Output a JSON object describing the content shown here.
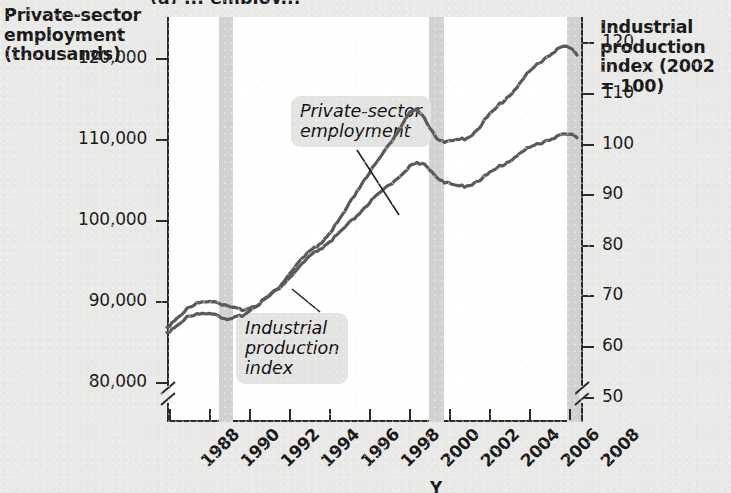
{
  "figure": {
    "clipped_title": "(a) ... employ...",
    "left_axis_title": "Private-sector\nemployment\n(thousands)",
    "right_axis_title": "Industrial\nproduction\nindex (2002\n= 100)",
    "x_axis_title": "Y"
  },
  "annotations": {
    "employment_label": "Private-sector\nemployment",
    "ipi_label": "Industrial\nproduction\nindex"
  },
  "axes": {
    "left_ticks": [
      "120,000",
      "110,000",
      "100,000",
      "90,000",
      "80,000"
    ],
    "right_ticks": [
      "120",
      "110",
      "100",
      "90",
      "80",
      "70",
      "60",
      "50"
    ],
    "x_ticks": [
      "1988",
      "1990",
      "1992",
      "1994",
      "1996",
      "1998",
      "2000",
      "2002",
      "2004",
      "2006",
      "2008"
    ]
  },
  "colors": {
    "page_background": "#e9e9e7",
    "plot_background": "#ffffff",
    "axis": "#2a2a2a",
    "series_line": "#5a5a5a",
    "recession_band": "#d2d2d0",
    "callout_background": "#e4e4e2"
  },
  "chart_data": {
    "type": "line",
    "title": "",
    "xlabel": "Year",
    "ylabel": "Private-sector employment (thousands)",
    "y2label": "Industrial production index (2002 = 100)",
    "xlim": [
      1988,
      2008.8
    ],
    "ylim": [
      75000,
      125000
    ],
    "y2lim": [
      45,
      125
    ],
    "grid": false,
    "legend": "inline-annotations",
    "x_tick_step": 2,
    "recession_bands": [
      {
        "start": 1990.5,
        "end": 1991.2
      },
      {
        "start": 2001.0,
        "end": 2001.75
      },
      {
        "start": 2007.9,
        "end": 2008.6
      }
    ],
    "series": [
      {
        "name": "Private-sector employment",
        "axis": "left",
        "units": "thousands",
        "x": [
          1988.0,
          1988.5,
          1989.0,
          1989.5,
          1990.0,
          1990.5,
          1991.0,
          1991.5,
          1992.0,
          1992.5,
          1993.0,
          1993.5,
          1994.0,
          1994.5,
          1995.0,
          1995.5,
          1996.0,
          1996.5,
          1997.0,
          1997.5,
          1998.0,
          1998.5,
          1999.0,
          1999.5,
          2000.0,
          2000.5,
          2001.0,
          2001.5,
          2002.0,
          2002.5,
          2003.0,
          2003.5,
          2004.0,
          2004.5,
          2005.0,
          2005.5,
          2006.0,
          2006.5,
          2007.0,
          2007.5,
          2008.0,
          2008.5
        ],
        "y": [
          86600,
          87800,
          88800,
          89500,
          89900,
          89800,
          89100,
          88800,
          88900,
          89400,
          90200,
          91200,
          92400,
          93700,
          95000,
          96000,
          96900,
          97900,
          99100,
          100400,
          101700,
          102800,
          103900,
          105000,
          106200,
          106800,
          106500,
          105200,
          104300,
          104000,
          104100,
          104600,
          105400,
          106200,
          107000,
          107800,
          108600,
          109200,
          109700,
          110200,
          110400,
          110100
        ]
      },
      {
        "name": "Industrial production index",
        "axis": "right",
        "units": "index 2002 = 100",
        "x": [
          1988.0,
          1988.5,
          1989.0,
          1989.5,
          1990.0,
          1990.5,
          1991.0,
          1991.5,
          1992.0,
          1992.5,
          1993.0,
          1993.5,
          1994.0,
          1994.5,
          1995.0,
          1995.5,
          1996.0,
          1996.5,
          1997.0,
          1997.5,
          1998.0,
          1998.5,
          1999.0,
          1999.5,
          2000.0,
          2000.5,
          2001.0,
          2001.5,
          2002.0,
          2002.5,
          2003.0,
          2003.5,
          2004.0,
          2004.5,
          2005.0,
          2005.5,
          2006.0,
          2006.5,
          2007.0,
          2007.5,
          2008.0,
          2008.5
        ],
        "y": [
          62.5,
          64.0,
          65.5,
          66.0,
          66.5,
          66.2,
          64.8,
          65.5,
          66.5,
          68.0,
          69.5,
          71.0,
          73.5,
          76.0,
          78.0,
          79.5,
          81.5,
          84.0,
          87.0,
          90.5,
          93.5,
          96.0,
          99.0,
          102.0,
          105.5,
          106.5,
          104.0,
          101.0,
          100.0,
          100.5,
          101.0,
          102.5,
          105.0,
          107.0,
          109.0,
          111.0,
          113.5,
          115.5,
          117.0,
          118.5,
          119.0,
          117.5
        ]
      }
    ]
  }
}
